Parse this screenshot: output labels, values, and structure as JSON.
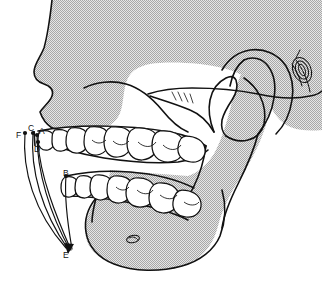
{
  "figure": {
    "background_color": "#ffffff",
    "bone_fill_color": "#d8d8d8",
    "stipple_color": "#9a9a9a",
    "outline_color": "#111111",
    "tooth_fill_color": "#ffffff"
  },
  "labels": [
    {
      "id": "F",
      "text": "F",
      "x": 16,
      "y": 131
    },
    {
      "id": "C",
      "text": "C",
      "x": 28,
      "y": 126
    },
    {
      "id": "A",
      "text": "A",
      "x": 39,
      "y": 128
    },
    {
      "id": "D",
      "text": "D",
      "x": 34,
      "y": 146
    },
    {
      "id": "B",
      "text": "B",
      "x": 63,
      "y": 170
    },
    {
      "id": "E",
      "text": "E",
      "x": 63,
      "y": 252
    }
  ],
  "anatomy_parts": [
    {
      "name": "cranial-vault-outline"
    },
    {
      "name": "frontal-bone-profile"
    },
    {
      "name": "nasal-bone-profile"
    },
    {
      "name": "anterior-nasal-spine"
    },
    {
      "name": "maxilla-alveolar-process"
    },
    {
      "name": "zygomatic-arch"
    },
    {
      "name": "coronoid-process"
    },
    {
      "name": "sigmoid-notch"
    },
    {
      "name": "mandibular-condyle"
    },
    {
      "name": "external-auditory-meatus"
    },
    {
      "name": "mandibular-ramus"
    },
    {
      "name": "mandibular-body"
    },
    {
      "name": "gonial-angle"
    },
    {
      "name": "mental-foramen"
    },
    {
      "name": "maxillary-teeth"
    },
    {
      "name": "mandibular-teeth"
    }
  ],
  "measurement_lines": [
    {
      "id": "A",
      "from": "maxillary-alveolar-point-A",
      "to": "point-E"
    },
    {
      "id": "B",
      "from": "mandibular-alveolar-point-B",
      "to": "point-E"
    },
    {
      "id": "C",
      "from": "point-C",
      "to": "point-E"
    },
    {
      "id": "D",
      "from": "point-D",
      "to": "point-E"
    },
    {
      "id": "F",
      "from": "point-F",
      "to": "point-E"
    }
  ]
}
